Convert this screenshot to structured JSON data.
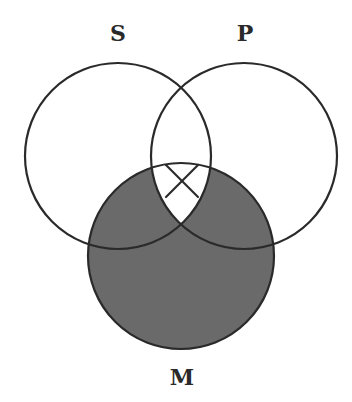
{
  "diagram": {
    "type": "venn",
    "title": "",
    "colors": {
      "background": "#ffffff",
      "stroke": "#2a2a2a",
      "shade": "#6a6a6a"
    },
    "circles": [
      {
        "id": "S",
        "label": "S",
        "cx": 118,
        "cy": 156,
        "r": 93,
        "label_x": 118,
        "label_y": 41
      },
      {
        "id": "P",
        "label": "P",
        "cx": 244,
        "cy": 156,
        "r": 93,
        "label_x": 245,
        "label_y": 41
      },
      {
        "id": "M",
        "label": "M",
        "cx": 181,
        "cy": 256,
        "r": 93,
        "label_x": 182,
        "label_y": 385
      }
    ],
    "shaded_regions": [
      "M only",
      "S and M not P",
      "P and M not S"
    ],
    "shaded_description": "All of M outside the S∩P∩M region (M minus S∩P) is shaded",
    "marks": [
      {
        "type": "X",
        "region": "S∩P∩M",
        "cx": 182,
        "cy": 181,
        "half_size": 16
      }
    ]
  }
}
